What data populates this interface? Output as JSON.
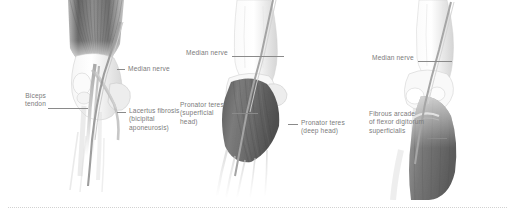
{
  "figure": {
    "background_color": "#ffffff",
    "label_color": "#7b7b7b",
    "leader_color": "#8a8a8a",
    "panels": [
      {
        "id": "panel-1",
        "name": "anterior-elbow-biceps-lacertus",
        "labels": [
          {
            "id": "median-nerve",
            "text": "Median nerve"
          },
          {
            "id": "biceps-tendon",
            "text": "Biceps\ntendon"
          },
          {
            "id": "lacertus-fibrosis",
            "text": "Lacertus fibrosis\n(bicipital\naponeurosis)"
          }
        ]
      },
      {
        "id": "panel-2",
        "name": "pronator-teres-heads",
        "labels": [
          {
            "id": "median-nerve",
            "text": "Median nerve"
          },
          {
            "id": "pronator-teres-superficial",
            "text": "Pronator teres\n(superficial\nhead)"
          },
          {
            "id": "pronator-teres-deep",
            "text": "Pronator teres\n(deep head)"
          }
        ]
      },
      {
        "id": "panel-3",
        "name": "fibrous-arcade-fds",
        "labels": [
          {
            "id": "median-nerve",
            "text": "Median nerve"
          },
          {
            "id": "fibrous-arcade",
            "text": "Fibrous arcade\nof flexor digitorum\nsuperficialis"
          }
        ]
      }
    ],
    "footer_rule": {
      "style": "dotted",
      "color": "#d2d2d2"
    }
  }
}
